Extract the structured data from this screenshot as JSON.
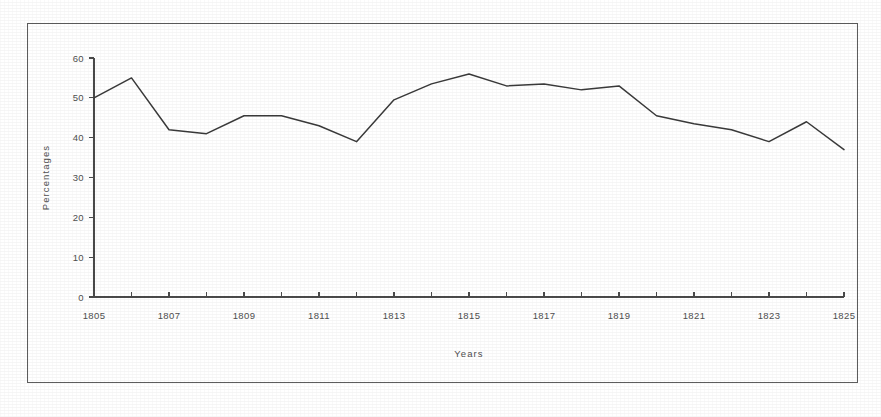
{
  "figure": {
    "border_color": "#5d5d5d",
    "background": "#ffffff"
  },
  "chart_data": {
    "type": "line",
    "title": "",
    "xlabel": "Years",
    "ylabel": "Percentages",
    "xlim": [
      1805,
      1825
    ],
    "ylim": [
      0,
      60
    ],
    "grid": false,
    "legend": null,
    "line_color": "#3a3a3a",
    "y_ticks": [
      0,
      10,
      20,
      30,
      40,
      50,
      60
    ],
    "y_tick_labels": [
      "0",
      "10",
      "20",
      "30",
      "40",
      "50",
      "60"
    ],
    "x_ticks": [
      1805,
      1806,
      1807,
      1808,
      1809,
      1810,
      1811,
      1812,
      1813,
      1814,
      1815,
      1816,
      1817,
      1818,
      1819,
      1820,
      1821,
      1822,
      1823,
      1824,
      1825
    ],
    "x_tick_labels": [
      "1805",
      "",
      "1807",
      "",
      "1809",
      "",
      "1811",
      "",
      "1813",
      "",
      "1815",
      "",
      "1817",
      "",
      "1819",
      "",
      "1821",
      "",
      "1823",
      "",
      "1825"
    ],
    "x": [
      1805,
      1806,
      1807,
      1808,
      1809,
      1810,
      1811,
      1812,
      1813,
      1814,
      1815,
      1816,
      1817,
      1818,
      1819,
      1820,
      1821,
      1822,
      1823,
      1824,
      1825
    ],
    "values": [
      50,
      55,
      42,
      41,
      45.5,
      45.5,
      43,
      39,
      49.5,
      53.5,
      56,
      53,
      53.5,
      52,
      53,
      45.5,
      43.5,
      42,
      39,
      44,
      37
    ]
  }
}
